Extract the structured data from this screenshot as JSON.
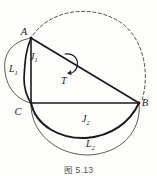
{
  "figure": {
    "caption": "图 5.13",
    "points": [
      {
        "id": "A",
        "label": "A",
        "x": 31,
        "y": 38
      },
      {
        "id": "B",
        "label": "B",
        "x": 139,
        "y": 103
      },
      {
        "id": "C",
        "label": "C",
        "x": 31,
        "y": 103
      }
    ],
    "point_labels": [
      {
        "name": "vertex-label-a",
        "text": "A",
        "x": 24,
        "y": 35
      },
      {
        "name": "vertex-label-b",
        "text": "B",
        "x": 145,
        "y": 106
      },
      {
        "name": "vertex-label-c",
        "text": "C",
        "x": 18,
        "y": 115
      }
    ],
    "curve_labels": [
      {
        "name": "curve-label-l1",
        "base": "L",
        "sub": "1",
        "x": 9,
        "y": 72
      },
      {
        "name": "curve-label-j1",
        "base": "J",
        "sub": "1",
        "x": 30,
        "y": 60
      },
      {
        "name": "curve-label-t",
        "base": "T",
        "sub": "",
        "x": 61,
        "y": 80
      },
      {
        "name": "curve-label-j2",
        "base": "J",
        "sub": "2",
        "x": 82,
        "y": 122
      },
      {
        "name": "curve-label-l2",
        "base": "L",
        "sub": "2",
        "x": 86,
        "y": 147
      }
    ],
    "segments": [
      {
        "name": "segment-ab",
        "x1": 31,
        "y1": 38,
        "x2": 139,
        "y2": 103
      },
      {
        "name": "segment-cb",
        "x1": 31,
        "y1": 103,
        "x2": 139,
        "y2": 103
      },
      {
        "name": "segment-ac",
        "x1": 31,
        "y1": 38,
        "x2": 31,
        "y2": 103
      }
    ],
    "arcs": [
      {
        "name": "arc-l1",
        "style": "thin",
        "d": "M 31 38 C 8 42 3 58 5 72 C 7 88 17 100 31 103"
      },
      {
        "name": "arc-j1",
        "style": "thick",
        "d": "M 31 38 C 25 52 25 64 24 78 C 24 90 27 97 31 103"
      },
      {
        "name": "arc-j2",
        "style": "thick",
        "d": "M 31 103 C 36 126 60 139 86 138 C 112 136 130 122 139 103"
      },
      {
        "name": "arc-l2",
        "style": "thin",
        "d": "M 31 103 C 30 132 56 155 88 155 C 120 154 142 132 139 103"
      },
      {
        "name": "arc-dashed",
        "style": "dashed",
        "d": "M 33 35 C 52 9 92 4 120 22 C 144 38 150 74 142 100"
      },
      {
        "name": "rotation-arrow",
        "style": "arrow",
        "d": "M 64 54 C 73 52 78 58 76 66 C 75 71 70 74 66 73"
      }
    ],
    "colors": {
      "ink": "#1a1a1a",
      "thin_stroke": "#4a4845",
      "background": "#fdfdfc",
      "caption_text": "#55514e"
    }
  }
}
